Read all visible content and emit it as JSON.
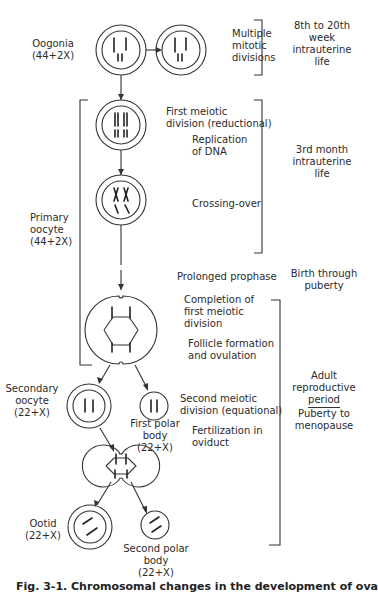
{
  "figure": {
    "caption": "Fig. 3-1. Chromosomal changes in the development of ova"
  },
  "cells": {
    "oogonia": {
      "name": "Oogonia",
      "karyotype": "(44+2X)"
    },
    "primary_oocyte": {
      "name": "Primary",
      "name2": "oocyte",
      "karyotype": "(44+2X)"
    },
    "secondary_oocyte": {
      "name": "Secondary",
      "name2": "oocyte",
      "karyotype": "(22+X)"
    },
    "first_polar_body": {
      "name": "First polar",
      "name2": "body",
      "karyotype": "(22+X)"
    },
    "ootid": {
      "name": "Ootid",
      "karyotype": "(22+X)"
    },
    "second_polar_body": {
      "name": "Second polar",
      "name2": "body",
      "karyotype": "(22+X)"
    }
  },
  "events": {
    "mitotic": [
      "Multiple",
      "mitotic",
      "divisions"
    ],
    "first_meiotic": [
      "First meiotic",
      "division (reductional)"
    ],
    "replication": [
      "Replication",
      "of DNA"
    ],
    "crossing_over": "Crossing-over",
    "prolonged_prophase": "Prolonged prophase",
    "completion": [
      "Completion of",
      "first meiotic",
      "division"
    ],
    "follicle": [
      "Follicle formation",
      "and ovulation"
    ],
    "second_meiotic": [
      "Second meiotic",
      "division (equational)"
    ],
    "fertilization": [
      "Fertilization in",
      "oviduct"
    ]
  },
  "timing": {
    "t1": [
      "8th to 20th",
      "week",
      "intrauterine",
      "life"
    ],
    "t2": [
      "3rd month",
      "intrauterine",
      "life"
    ],
    "t3": [
      "Birth through",
      "puberty"
    ],
    "t4": [
      "Adult",
      "reproductive",
      "period"
    ],
    "t4b": [
      "Puberty to",
      "menopause"
    ]
  }
}
